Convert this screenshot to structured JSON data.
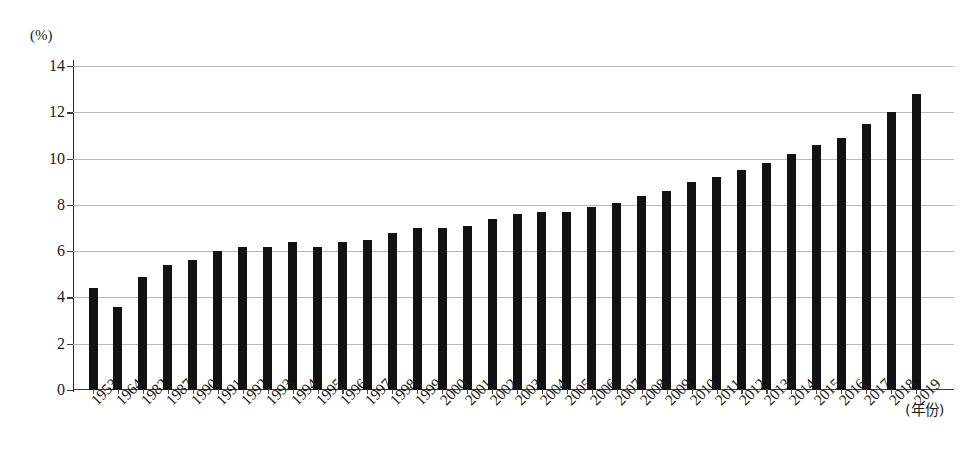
{
  "chart_data": {
    "type": "bar",
    "title": "",
    "subtitle": "",
    "xlabel": "(年份)",
    "ylabel": "(%)",
    "ylim": [
      0,
      14
    ],
    "ytick_labels": [
      "0",
      "2",
      "4",
      "6",
      "8",
      "10",
      "12",
      "14"
    ],
    "ytick_values": [
      0,
      2,
      4,
      6,
      8,
      10,
      12,
      14
    ],
    "grid": true,
    "legend": null,
    "legend_position": "none",
    "bar_color": "#121212",
    "categories": [
      "1953",
      "1964",
      "1982",
      "1987",
      "1990",
      "1991",
      "1992",
      "1993",
      "1994",
      "1995",
      "1996",
      "1997",
      "1998",
      "1999",
      "2000",
      "2001",
      "2002",
      "2003",
      "2004",
      "2005",
      "2006",
      "2007",
      "2008",
      "2009",
      "2010",
      "2011",
      "2012",
      "2013",
      "2014",
      "2015",
      "2016",
      "2017",
      "2018",
      "2019"
    ],
    "values": [
      4.4,
      3.6,
      4.9,
      5.4,
      5.6,
      6.0,
      6.2,
      6.2,
      6.4,
      6.2,
      6.4,
      6.5,
      6.8,
      7.0,
      7.0,
      7.1,
      7.4,
      7.6,
      7.7,
      7.7,
      7.9,
      8.1,
      8.4,
      8.6,
      9.0,
      9.2,
      9.5,
      9.8,
      10.2,
      10.6,
      10.9,
      11.5,
      12.0,
      12.8
    ]
  },
  "axes": {
    "unit_label": "(%)",
    "x_caption": "(年份)"
  }
}
